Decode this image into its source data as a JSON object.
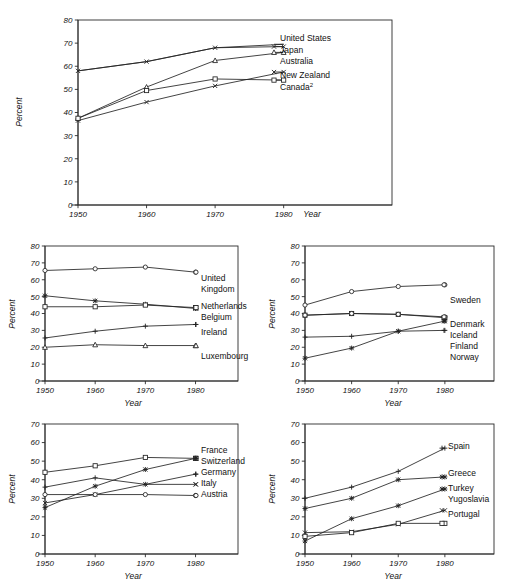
{
  "page": {
    "faint_header_text": "",
    "percent_axis_title": "Percent",
    "year_axis_title": "Year"
  },
  "chart_data": [
    {
      "id": "panel-oceania-north-america",
      "type": "line",
      "title": "",
      "xlabel": "Year",
      "ylabel": "Percent",
      "x": [
        1950,
        1960,
        1970,
        1980
      ],
      "xticklabels": [
        "1950",
        "1960",
        "1970",
        "1980"
      ],
      "ylim": [
        0,
        80
      ],
      "yticks": [
        0,
        10,
        20,
        30,
        40,
        50,
        60,
        70,
        80
      ],
      "grid": false,
      "legend_position": "right-inline",
      "series": [
        {
          "name": "United States",
          "marker": "none",
          "values": [
            58.0,
            62.0,
            68.0,
            69.5
          ]
        },
        {
          "name": "Japan",
          "marker": "x",
          "values": [
            58.0,
            62.0,
            68.0,
            68.5
          ]
        },
        {
          "name": "Australia",
          "marker": "triangle",
          "values": [
            37.5,
            51.0,
            62.5,
            66.0
          ]
        },
        {
          "name": "New Zealand",
          "marker": "x",
          "values": [
            36.5,
            44.5,
            51.5,
            57.5
          ]
        },
        {
          "name": "Canada²",
          "marker": "square",
          "values": [
            37.5,
            49.5,
            54.5,
            54.0
          ]
        }
      ]
    },
    {
      "id": "panel-western-europe",
      "type": "line",
      "title": "",
      "xlabel": "Year",
      "ylabel": "Percent",
      "x": [
        1950,
        1960,
        1970,
        1980
      ],
      "xticklabels": [
        "1950",
        "1960",
        "1970",
        "1980"
      ],
      "ylim": [
        0,
        80
      ],
      "yticks": [
        0,
        10,
        20,
        30,
        40,
        50,
        60,
        70,
        80
      ],
      "grid": false,
      "legend_position": "right-inline",
      "series": [
        {
          "name": "United Kingdom",
          "marker": "circle",
          "values": [
            65.5,
            66.5,
            67.5,
            64.5
          ]
        },
        {
          "name": "Netherlands",
          "marker": "star",
          "values": [
            50.5,
            47.5,
            45.5,
            43.0
          ]
        },
        {
          "name": "Belgium",
          "marker": "square",
          "values": [
            44.0,
            44.0,
            45.0,
            43.5
          ]
        },
        {
          "name": "Ireland",
          "marker": "plus",
          "values": [
            25.5,
            29.5,
            32.5,
            33.5
          ]
        },
        {
          "name": "Luxembourg",
          "marker": "triangle",
          "values": [
            20.0,
            21.5,
            21.0,
            21.0
          ]
        }
      ]
    },
    {
      "id": "panel-nordic",
      "type": "line",
      "title": "",
      "xlabel": "Year",
      "ylabel": "Percent",
      "x": [
        1950,
        1960,
        1970,
        1980
      ],
      "xticklabels": [
        "1950",
        "1960",
        "1970",
        "1980"
      ],
      "ylim": [
        0,
        80
      ],
      "yticks": [
        0,
        10,
        20,
        30,
        40,
        50,
        60,
        70,
        80
      ],
      "grid": false,
      "legend_position": "right-inline",
      "series": [
        {
          "name": "Sweden",
          "marker": "circle",
          "values": [
            45.0,
            53.0,
            56.0,
            57.0
          ]
        },
        {
          "name": "Denmark",
          "marker": "square",
          "values": [
            39.0,
            40.0,
            39.5,
            37.5
          ]
        },
        {
          "name": "Iceland",
          "marker": "circle",
          "values": [
            39.0,
            40.0,
            39.5,
            38.0
          ]
        },
        {
          "name": "Finland",
          "marker": "star",
          "values": [
            13.5,
            19.5,
            29.5,
            35.5
          ]
        },
        {
          "name": "Norway",
          "marker": "plus",
          "values": [
            26.0,
            26.5,
            29.5,
            30.0
          ]
        }
      ]
    },
    {
      "id": "panel-central-europe",
      "type": "line",
      "title": "",
      "xlabel": "Year",
      "ylabel": "Percent",
      "x": [
        1950,
        1960,
        1970,
        1980
      ],
      "xticklabels": [
        "1950",
        "1960",
        "1970",
        "1980"
      ],
      "ylim": [
        0,
        70
      ],
      "yticks": [
        0,
        10,
        20,
        30,
        40,
        50,
        60,
        70
      ],
      "grid": false,
      "legend_position": "right-inline",
      "series": [
        {
          "name": "France",
          "marker": "square",
          "values": [
            44.0,
            47.5,
            52.0,
            51.5
          ]
        },
        {
          "name": "Switzerland",
          "marker": "star",
          "values": [
            25.0,
            36.5,
            45.5,
            51.5
          ]
        },
        {
          "name": "Germany",
          "marker": "plus",
          "values": [
            36.0,
            41.0,
            37.5,
            43.0
          ]
        },
        {
          "name": "Italy",
          "marker": "x",
          "values": [
            27.5,
            32.0,
            37.5,
            37.5
          ]
        },
        {
          "name": "Austria",
          "marker": "circle",
          "values": [
            32.0,
            32.0,
            32.0,
            31.5
          ]
        }
      ]
    },
    {
      "id": "panel-southern-europe",
      "type": "line",
      "title": "",
      "xlabel": "Year",
      "ylabel": "Percent",
      "x": [
        1950,
        1960,
        1970,
        1980
      ],
      "xticklabels": [
        "1950",
        "1960",
        "1970",
        "1980"
      ],
      "ylim": [
        0,
        70
      ],
      "yticks": [
        0,
        10,
        20,
        30,
        40,
        50,
        60,
        70
      ],
      "grid": false,
      "legend_position": "right-inline",
      "series": [
        {
          "name": "Spain",
          "marker": "plus",
          "values": [
            30.0,
            36.0,
            44.5,
            57.0
          ]
        },
        {
          "name": "Greece",
          "marker": "star",
          "values": [
            24.5,
            30.0,
            40.0,
            41.5
          ]
        },
        {
          "name": "Turkey",
          "marker": "star",
          "values": [
            7.0,
            19.0,
            26.0,
            35.0
          ]
        },
        {
          "name": "Yugoslavia",
          "marker": "x",
          "values": [
            11.5,
            12.0,
            16.0,
            23.5
          ]
        },
        {
          "name": "Portugal",
          "marker": "square",
          "values": [
            9.5,
            11.5,
            16.5,
            16.5
          ]
        }
      ]
    }
  ],
  "panels": [
    {
      "name": "panel-oceania-north-america",
      "legend_labels": [
        "United States",
        "Japan",
        "Australia",
        "New Zealand",
        "Canada²"
      ]
    },
    {
      "name": "panel-western-europe",
      "legend_labels": [
        "United",
        "Kingdom",
        "Netherlands",
        "Belgium",
        "Ireland",
        "Luxembourg"
      ]
    },
    {
      "name": "panel-nordic",
      "legend_labels": [
        "Sweden",
        "Denmark",
        "Iceland",
        "Finland",
        "Norway"
      ]
    },
    {
      "name": "panel-central-europe",
      "legend_labels": [
        "France",
        "Switzerland",
        "Germany",
        "Italy",
        "Austria"
      ]
    },
    {
      "name": "panel-southern-europe",
      "legend_labels": [
        "Spain",
        "Greece",
        "Turkey",
        "Yugoslavia",
        "Portugal"
      ]
    }
  ]
}
